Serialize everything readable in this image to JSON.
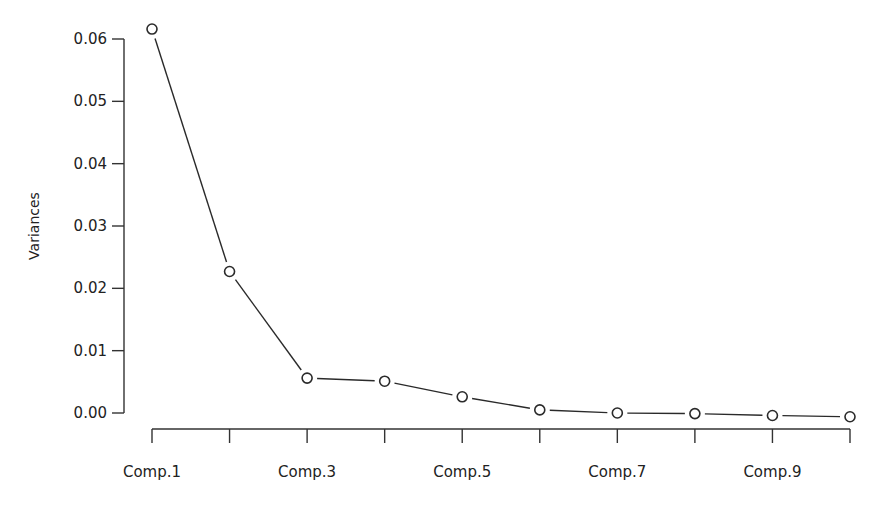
{
  "chart_data": {
    "type": "line",
    "title": "",
    "xlabel": "",
    "ylabel": "Variances",
    "categories": [
      "Comp.1",
      "Comp.2",
      "Comp.3",
      "Comp.4",
      "Comp.5",
      "Comp.6",
      "Comp.7",
      "Comp.8",
      "Comp.9",
      "Comp.10"
    ],
    "x_tick_labels_shown": [
      "Comp.1",
      "",
      "Comp.3",
      "",
      "Comp.5",
      "",
      "Comp.7",
      "",
      "Comp.9",
      ""
    ],
    "series": [
      {
        "name": "Variances",
        "values": [
          0.0616,
          0.0227,
          0.0056,
          0.0051,
          0.0026,
          0.0005,
          0.0,
          -0.0001,
          -0.0004,
          -0.0006
        ],
        "marker": "open-circle",
        "color": "#2a2a2a"
      }
    ],
    "y_ticks": [
      0.0,
      0.01,
      0.02,
      0.03,
      0.04,
      0.05,
      0.06
    ],
    "y_tick_labels": [
      "0.00",
      "0.01",
      "0.02",
      "0.03",
      "0.04",
      "0.05",
      "0.06"
    ],
    "ylim": [
      0.0,
      0.06
    ],
    "grid": false,
    "legend": "none"
  }
}
